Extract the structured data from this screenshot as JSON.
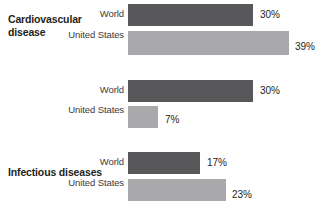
{
  "chart_data": {
    "type": "bar",
    "orientation": "horizontal",
    "title": "",
    "subtitle": "",
    "xlabel": "",
    "ylabel": "",
    "grid": false,
    "legend": "none",
    "xlim": [
      0,
      45
    ],
    "value_suffix": "%",
    "categories": [
      "Cardiovascular disease",
      "Infectious diseases",
      "Cancers"
    ],
    "series": [
      {
        "name": "World",
        "color": "#58585a",
        "values": [
          30,
          30,
          17
        ],
        "value_labels": [
          "30%",
          "30%",
          "17%"
        ]
      },
      {
        "name": "United States",
        "color": "#a9a9ab",
        "values": [
          39,
          7,
          23
        ],
        "value_labels": [
          "39%",
          "7%",
          "23%"
        ]
      }
    ]
  },
  "groups": [
    {
      "label": "Cardiovascular disease",
      "rows": [
        {
          "series": "World",
          "value_label": "30%"
        },
        {
          "series": "United States",
          "value_label": "39%"
        }
      ]
    },
    {
      "label": "Infectious diseases",
      "rows": [
        {
          "series": "World",
          "value_label": "30%"
        },
        {
          "series": "United States",
          "value_label": "7%"
        }
      ]
    },
    {
      "label": "Cancers",
      "rows": [
        {
          "series": "World",
          "value_label": "17%"
        },
        {
          "series": "United States",
          "value_label": "23%"
        }
      ]
    }
  ],
  "series_names": {
    "world": "World",
    "united_states": "United States"
  },
  "colors": {
    "world_bar": "#58585a",
    "united_states_bar": "#a9a9ab",
    "text": "#231f20",
    "series_label_text": "#3b3b3d",
    "background": "#ffffff"
  }
}
